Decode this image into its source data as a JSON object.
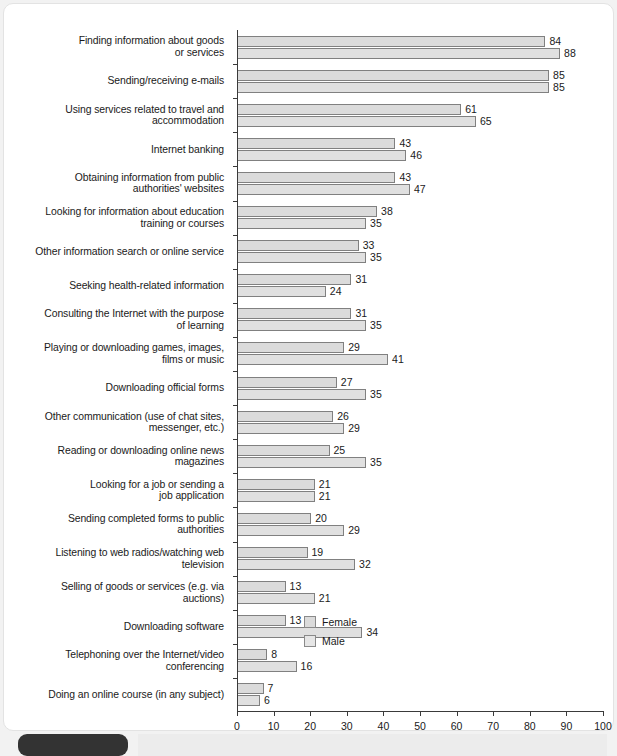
{
  "chart_data": {
    "type": "bar",
    "orientation": "horizontal",
    "title": "",
    "xlabel": "",
    "ylabel": "",
    "xlim": [
      0,
      100
    ],
    "xticks": [
      0,
      10,
      20,
      30,
      40,
      50,
      60,
      70,
      80,
      90,
      100
    ],
    "grid": false,
    "legend_position": "bottom-right",
    "categories": [
      "Finding information about goods\nor services",
      "Sending/receiving e-mails",
      "Using services related to travel and\naccommodation",
      "Internet banking",
      "Obtaining information from public\nauthorities' websites",
      "Looking for information about education\ntraining or courses",
      "Other information search or online service",
      "Seeking health-related information",
      "Consulting the Internet with the purpose\nof learning",
      "Playing or downloading games, images,\nfilms or music",
      "Downloading official forms",
      "Other communication (use of chat sites,\nmessenger, etc.)",
      "Reading or downloading online news\nmagazines",
      "Looking for a job or sending a\njob application",
      "Sending completed forms to public\nauthorities",
      "Listening to web radios/watching web\ntelevision",
      "Selling of goods or services (e.g. via\nauctions)",
      "Downloading software",
      "Telephoning over the Internet/video\nconferencing",
      "Doing an online course (in any subject)"
    ],
    "series": [
      {
        "name": "Female",
        "color": "#dbdbdb",
        "values": [
          84,
          85,
          61,
          43,
          43,
          38,
          33,
          31,
          31,
          29,
          27,
          26,
          25,
          21,
          20,
          19,
          13,
          13,
          8,
          7
        ]
      },
      {
        "name": "Male",
        "color": "#e0e0e0",
        "values": [
          88,
          85,
          65,
          46,
          47,
          35,
          35,
          24,
          35,
          41,
          35,
          29,
          35,
          21,
          29,
          32,
          21,
          34,
          16,
          6
        ]
      }
    ]
  },
  "legend": {
    "items": [
      {
        "label": "Female"
      },
      {
        "label": "Male"
      }
    ]
  },
  "footer": {
    "caption": ""
  }
}
